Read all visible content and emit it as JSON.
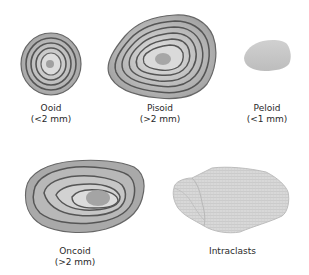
{
  "diagram": {
    "items": [
      {
        "name": "Ooid",
        "size": "(<2 mm)"
      },
      {
        "name": "Pisoid",
        "size": "(>2 mm)"
      },
      {
        "name": "Peloid",
        "size": "(<1 mm)"
      },
      {
        "name": "Oncoid",
        "size": "(>2 mm)"
      },
      {
        "name": "Intraclasts",
        "size": ""
      }
    ],
    "colors": {
      "outline": "#5a5a5a",
      "fill_outer": "#a9a9a9",
      "fill_inner": "#d0d0d0",
      "nucleus": "#9a9a9a",
      "peloid": "#c8c8c8",
      "intraclast": "#d6d6d6"
    }
  }
}
